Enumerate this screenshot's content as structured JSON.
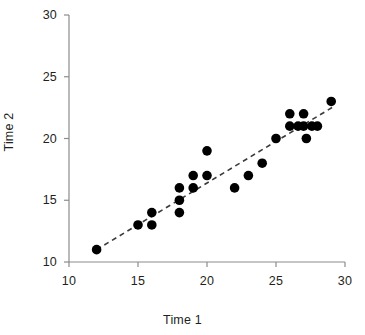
{
  "chart_data": {
    "type": "scatter",
    "title": "",
    "xlabel": "Time 1",
    "ylabel": "Time 2",
    "xlim": [
      10,
      30
    ],
    "ylim": [
      10,
      30
    ],
    "xticks": [
      10,
      15,
      20,
      25,
      30
    ],
    "yticks": [
      10,
      15,
      20,
      25,
      30
    ],
    "xtick_labels": [
      "10",
      "15",
      "20",
      "25",
      "30"
    ],
    "ytick_labels": [
      "10",
      "15",
      "20",
      "25",
      "30"
    ],
    "grid": false,
    "legend": null,
    "marker": "filled-circle",
    "marker_color": "#000000",
    "marker_size": 8,
    "axis_color": "#8c8c8c",
    "points": [
      {
        "x": 12,
        "y": 11
      },
      {
        "x": 15,
        "y": 13
      },
      {
        "x": 16,
        "y": 14
      },
      {
        "x": 16,
        "y": 13
      },
      {
        "x": 18,
        "y": 14
      },
      {
        "x": 18,
        "y": 15
      },
      {
        "x": 18,
        "y": 16
      },
      {
        "x": 19,
        "y": 16
      },
      {
        "x": 19,
        "y": 17
      },
      {
        "x": 20,
        "y": 17
      },
      {
        "x": 20,
        "y": 19
      },
      {
        "x": 22,
        "y": 16
      },
      {
        "x": 23,
        "y": 17
      },
      {
        "x": 24,
        "y": 18
      },
      {
        "x": 25,
        "y": 20
      },
      {
        "x": 26,
        "y": 21
      },
      {
        "x": 26,
        "y": 22
      },
      {
        "x": 26.6,
        "y": 21
      },
      {
        "x": 27,
        "y": 21
      },
      {
        "x": 27,
        "y": 22
      },
      {
        "x": 27.2,
        "y": 20
      },
      {
        "x": 27.6,
        "y": 21
      },
      {
        "x": 28,
        "y": 21
      },
      {
        "x": 29,
        "y": 23
      }
    ],
    "trendline": {
      "style": "dashed",
      "color": "#3b3b3b",
      "x_start": 12,
      "y_start": 11,
      "x_end": 29.2,
      "y_end": 22.6
    }
  },
  "axes": {
    "y_title": "Time 2",
    "x_title": "Time 1"
  }
}
